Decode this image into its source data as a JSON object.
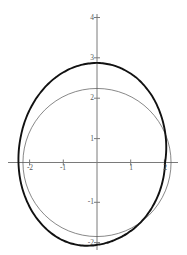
{
  "figure": {
    "background_color": "#ffffff",
    "axis_color": "#7a7a7a",
    "tick_label_color": "#585858",
    "curve_outer_color": "#111111",
    "curve_inner_color": "#555555"
  },
  "chart_data": {
    "type": "line",
    "title": "",
    "subtitle": "",
    "xlabel": "",
    "ylabel": "",
    "grid": false,
    "legend": "none",
    "axes_style": "cartesian-crosshair",
    "xlim": [
      -2.6,
      2.4
    ],
    "ylim": [
      -2.6,
      4.3
    ],
    "xticks": [
      -2,
      -1,
      1
    ],
    "xtick_labels": [
      "-2",
      "-1",
      "1"
    ],
    "yticks": [
      -2,
      -1,
      1,
      2,
      3,
      4
    ],
    "ytick_labels": [
      "-2",
      "-1",
      "1",
      "2",
      "3",
      "4"
    ],
    "hidden_xtick_note": "2",
    "series": [
      {
        "name": "outer-curve",
        "type": "closed-polar",
        "description": "limacon r = 2.25 + 0.25*cos(theta + pi/2) style closed loop, thick black",
        "linewidth": 1.9,
        "color": "#111111",
        "polar_r_formula": "r(t) = 2.25 - 0.25*sin(t) + 0.04*cos(2t)",
        "points_theta_deg": [
          0,
          15,
          30,
          45,
          60,
          75,
          90,
          105,
          120,
          135,
          150,
          165,
          180,
          195,
          210,
          225,
          240,
          255,
          270,
          285,
          300,
          315,
          330,
          345,
          360
        ],
        "points_r": [
          2.02,
          2.12,
          2.22,
          2.32,
          2.4,
          2.45,
          2.47,
          2.46,
          2.44,
          2.41,
          2.38,
          2.35,
          2.33,
          2.31,
          2.28,
          2.24,
          2.19,
          2.12,
          2.04,
          1.99,
          1.97,
          1.97,
          1.98,
          2.0,
          2.02
        ]
      },
      {
        "name": "inner-circle",
        "type": "circle",
        "description": "circle of radius 2 centered at origin, thin grey",
        "linewidth": 0.7,
        "color": "#555555",
        "center": [
          0,
          0
        ],
        "radius": 2
      }
    ],
    "annotations": []
  },
  "axis": {
    "x_axis_name": "x-axis",
    "y_axis_name": "y-axis"
  }
}
